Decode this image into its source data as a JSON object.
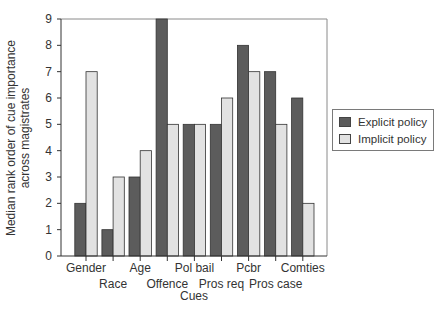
{
  "chart_data": {
    "type": "bar",
    "title": "",
    "xlabel": "Cues",
    "ylabel": "Median rank order of cue importance across magistrates",
    "ylabel_lines": [
      "Median rank order of cue importance",
      "across magistrates"
    ],
    "ylim": [
      0,
      9
    ],
    "yticks": [
      0,
      1,
      2,
      3,
      4,
      5,
      6,
      7,
      8,
      9
    ],
    "grid": false,
    "legend_position": "right",
    "categories": [
      "Gender",
      "Race",
      "Age",
      "Offence",
      "Pol bail",
      "Pros req",
      "Pcbr",
      "Pros case",
      "Comties"
    ],
    "series": [
      {
        "name": "Explicit policy",
        "color": "#5c5c5c",
        "values": [
          2,
          1,
          3,
          9,
          5,
          5,
          8,
          7,
          6
        ]
      },
      {
        "name": "Implicit policy",
        "color": "#e2e2e2",
        "values": [
          7,
          3,
          4,
          5,
          5,
          6,
          7,
          5,
          2
        ]
      }
    ]
  }
}
